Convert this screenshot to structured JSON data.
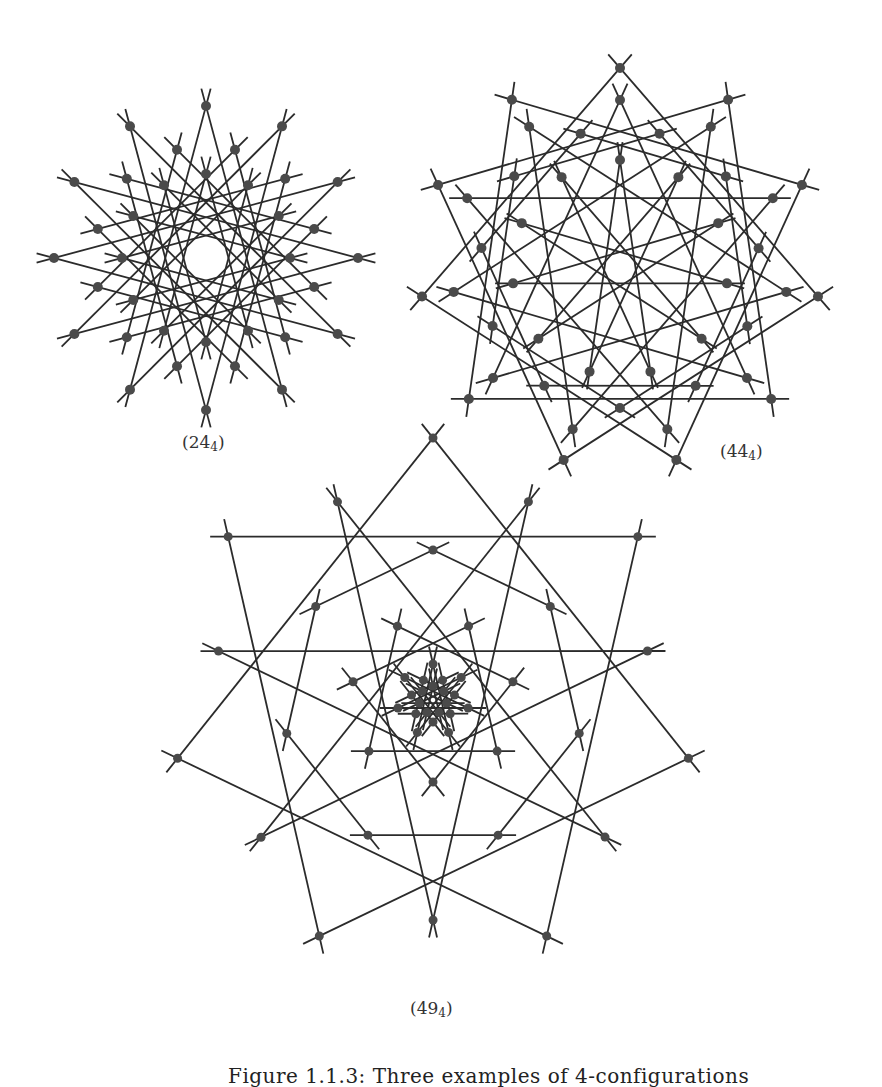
{
  "figure": {
    "caption": "Figure 1.1.3: Three examples of 4-configurations",
    "line_color": "#2b2b2b",
    "point_color": "#4a4a4a"
  },
  "configurations": [
    {
      "id": "c24",
      "label_main": "(24",
      "label_sub": "4",
      "label_close": ")",
      "label_pos": [
        182,
        432
      ],
      "symmetry": 12,
      "center": [
        206,
        258
      ],
      "point_rings": [
        152,
        112,
        84
      ],
      "ring_offsets_deg": [
        90,
        75,
        90
      ],
      "inner_circle_radius": 40,
      "line_skips": [
        5,
        4
      ]
    },
    {
      "id": "c44",
      "label_main": "(44",
      "label_sub": "4",
      "label_close": ")",
      "label_pos": [
        720,
        441
      ],
      "symmetry": 11,
      "center": [
        620,
        268
      ],
      "point_rings": [
        200,
        168,
        140,
        108
      ],
      "ring_offsets_deg": [
        -90,
        -90,
        -73.6,
        -90
      ],
      "inner_circle_radius": 60,
      "line_skips": [
        3,
        4,
        2,
        5
      ]
    },
    {
      "id": "c49",
      "label_main": "(49",
      "label_sub": "4",
      "label_close": ")",
      "label_pos": [
        410,
        998
      ],
      "symmetry": 7,
      "center": [
        433,
        700
      ],
      "point_rings": [
        262,
        220,
        150,
        82,
        36,
        22,
        14
      ],
      "ring_offsets_deg": [
        -90,
        -64.3,
        -90,
        -64.3,
        -90,
        -64.3,
        -90
      ],
      "inner_circle_radius": 10,
      "line_skips": [
        2,
        3,
        1,
        2,
        3,
        2,
        3
      ]
    }
  ]
}
